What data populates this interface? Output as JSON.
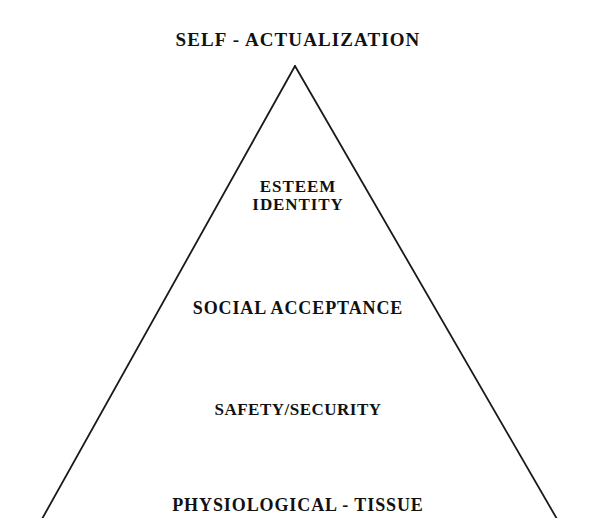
{
  "diagram": {
    "type": "pyramid-hierarchy",
    "background_color": "#ffffff",
    "stroke_color": "#1a1a1a",
    "text_color": "#111111",
    "shape": {
      "name": "triangle-outline",
      "apex": {
        "x": 295,
        "y": 66
      },
      "base_left": {
        "x": 42,
        "y": 518
      },
      "base_right": {
        "x": 557,
        "y": 518
      },
      "stroke_width": 1.8,
      "filled": false
    },
    "levels": [
      {
        "id": "self-actualization",
        "rank": 5,
        "position": "apex",
        "lines": [
          "SELF - ACTUALIZATION"
        ],
        "label": "SELF - ACTUALIZATION"
      },
      {
        "id": "esteem-identity",
        "rank": 4,
        "position": "upper",
        "lines": [
          "ESTEEM",
          "IDENTITY"
        ],
        "label": "ESTEEM IDENTITY"
      },
      {
        "id": "social-acceptance",
        "rank": 3,
        "position": "middle",
        "lines": [
          "SOCIAL ACCEPTANCE"
        ],
        "label": "SOCIAL ACCEPTANCE"
      },
      {
        "id": "safety-security",
        "rank": 2,
        "position": "lower",
        "lines": [
          "SAFETY/SECURITY"
        ],
        "label": "SAFETY/SECURITY"
      },
      {
        "id": "physiological-tissue",
        "rank": 1,
        "position": "base",
        "lines": [
          "PHYSIOLOGICAL - TISSUE"
        ],
        "label": "PHYSIOLOGICAL - TISSUE"
      }
    ]
  }
}
